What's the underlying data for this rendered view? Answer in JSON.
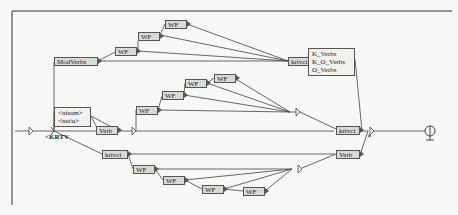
{
  "diagram": {
    "type": "finite-state graph (Unitex/NooJ style)",
    "initial_label": "<KRTV",
    "nodes": {
      "modverbs": "ModVerbs",
      "wf": "WF",
      "krivci": "krivci",
      "verb": "Verb",
      "neg_box": [
        "<nisam>",
        "<neću>"
      ],
      "verb_classes": [
        "K_Verbs",
        "K_O_Verbs",
        "O_Verbs"
      ]
    },
    "wf_label": "WF",
    "krivci_label": "krivci",
    "verb_label": "Verb"
  },
  "colors": {
    "node_fill": "#d9d9d6",
    "node_border": "#555555",
    "edge": "#555555",
    "background": "#f7f7f5"
  }
}
